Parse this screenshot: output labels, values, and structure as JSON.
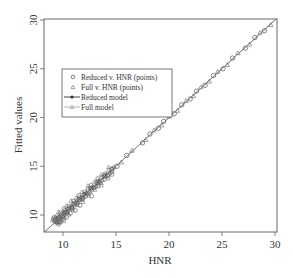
{
  "chart_data": {
    "type": "scatter",
    "title": "",
    "xlabel": "HNR",
    "ylabel": "Fitted values",
    "xlim": [
      8.2,
      30.2
    ],
    "ylim": [
      8.2,
      30.2
    ],
    "xticks": [
      10,
      15,
      20,
      25,
      30
    ],
    "yticks": [
      10,
      15,
      20,
      25,
      30
    ],
    "grid": false,
    "legend_position": "upper-left (inset)",
    "legend": [
      {
        "label": "Reduced v. HNR (points)",
        "symbol": "circle"
      },
      {
        "label": "Full v. HNR (points)",
        "symbol": "triangle"
      },
      {
        "label": "Reduced model",
        "symbol": "line-with-circle"
      },
      {
        "label": "Full model",
        "symbol": "line-with-triangle"
      }
    ],
    "series": [
      {
        "name": "Reduced v. HNR (points)",
        "marker": "circle",
        "x": [
          9.3,
          9.6,
          9.9,
          10.1,
          10.3,
          10.5,
          10.8,
          11.0,
          11.3,
          11.5,
          11.8,
          12.0,
          12.3,
          12.6,
          12.9,
          13.2,
          13.5,
          13.9,
          14.2,
          14.6,
          15.1,
          16.0,
          17.5,
          18.2,
          19.0,
          19.5,
          20.5,
          21.2,
          22.0,
          22.6,
          23.4,
          24.2,
          25.1,
          26.0,
          27.2,
          28.1,
          29.0
        ],
        "y": [
          9.4,
          9.7,
          9.8,
          10.2,
          10.3,
          10.6,
          10.7,
          11.1,
          11.2,
          11.6,
          11.7,
          12.1,
          12.2,
          12.7,
          12.8,
          13.3,
          13.4,
          14.0,
          14.1,
          14.7,
          15.0,
          16.1,
          17.4,
          18.3,
          18.9,
          19.6,
          20.4,
          21.3,
          21.9,
          22.7,
          23.3,
          24.3,
          25.0,
          26.1,
          27.1,
          28.2,
          28.9
        ]
      },
      {
        "name": "Full v. HNR (points)",
        "marker": "triangle",
        "x": [
          9.4,
          9.7,
          10.0,
          10.2,
          10.4,
          10.7,
          10.9,
          11.2,
          11.4,
          11.7,
          11.9,
          12.2,
          12.5,
          12.8,
          13.1,
          13.4,
          13.7,
          14.0,
          14.4,
          14.8,
          15.5,
          16.5,
          17.8,
          18.6,
          19.3,
          20.0,
          20.8,
          21.6,
          22.3,
          23.0,
          23.8,
          24.6,
          25.5,
          26.5,
          27.6,
          28.6,
          29.6
        ],
        "y": [
          9.3,
          9.8,
          9.9,
          10.3,
          10.3,
          10.8,
          10.8,
          11.3,
          11.3,
          11.8,
          11.8,
          12.3,
          12.4,
          12.9,
          13.0,
          13.5,
          13.6,
          14.1,
          14.3,
          14.9,
          15.4,
          16.6,
          17.7,
          18.7,
          19.2,
          20.1,
          20.7,
          21.7,
          22.2,
          23.1,
          23.7,
          24.7,
          25.4,
          26.6,
          27.5,
          28.7,
          29.5
        ]
      },
      {
        "name": "Reduced model",
        "type": "line",
        "x": [
          8.2,
          30.2
        ],
        "y": [
          8.2,
          30.2
        ]
      },
      {
        "name": "Full model",
        "type": "line",
        "x": [
          8.2,
          30.2
        ],
        "y": [
          8.2,
          30.2
        ]
      }
    ]
  }
}
